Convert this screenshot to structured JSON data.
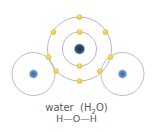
{
  "diagram": {
    "title": "water",
    "formula_prefix": "H",
    "formula_sub": "2",
    "formula_suffix": "O",
    "structural_formula": "H—O—H",
    "colors": {
      "nucleus": "#2f5fa8",
      "oxygen_nucleus": "#1f3050",
      "electron": "#f2cf3c",
      "ring": "#9a9a9a",
      "text": "#5a5a5a"
    },
    "atoms": [
      {
        "name": "hydrogen-left",
        "element": "H"
      },
      {
        "name": "oxygen",
        "element": "O"
      },
      {
        "name": "hydrogen-right",
        "element": "H"
      }
    ]
  }
}
